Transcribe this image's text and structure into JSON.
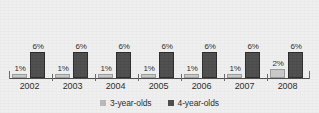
{
  "chart_data": {
    "type": "bar",
    "title": "",
    "subtitle": "",
    "xlabel": "",
    "ylabel": "",
    "ylim": [
      0,
      8
    ],
    "grid": false,
    "legend_position": "bottom-center",
    "categories": [
      "2002",
      "2003",
      "2004",
      "2005",
      "2006",
      "2007",
      "2008"
    ],
    "series": [
      {
        "name": "3-year-olds",
        "color": "#c9c9c9",
        "values": [
          1,
          1,
          1,
          1,
          1,
          1,
          2
        ],
        "labels": [
          "1%",
          "1%",
          "1%",
          "1%",
          "1%",
          "1%",
          "2%"
        ]
      },
      {
        "name": "4-year-olds",
        "color": "#4c4c4c",
        "values": [
          6,
          6,
          6,
          6,
          6,
          6,
          6
        ],
        "labels": [
          "6%",
          "6%",
          "6%",
          "6%",
          "6%",
          "6%",
          "6%"
        ]
      }
    ]
  },
  "legend": {
    "items": [
      {
        "label": "3-year-olds",
        "color": "#b9b9b9"
      },
      {
        "label": "4-year-olds",
        "color": "#4c4c4c"
      }
    ]
  },
  "colors": {
    "background": "#efefef",
    "axis": "#4a4a4a",
    "text": "#2c2c2c",
    "series_a": "#c9c9c9",
    "series_b": "#4c4c4c"
  }
}
